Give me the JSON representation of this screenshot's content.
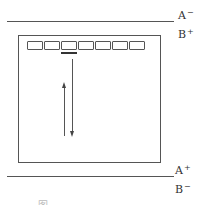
{
  "diagram": {
    "type": "gel-electrophoresis-schematic",
    "top_electrode": {
      "label_above": {
        "letter": "A",
        "sign": "−"
      },
      "label_below": {
        "letter": "B",
        "sign": "+"
      }
    },
    "bottom_electrode": {
      "label_above": {
        "letter": "A",
        "sign": "+"
      },
      "label_below": {
        "letter": "B",
        "sign": "−"
      }
    },
    "gel": {
      "well_count": 7,
      "highlighted_well_index": 2
    },
    "arrows": [
      {
        "name": "migration-down",
        "direction": "down"
      },
      {
        "name": "migration-up",
        "direction": "up"
      }
    ],
    "caption": "图 ─ ─  ─ ─ ─ ─ ─ ─"
  }
}
